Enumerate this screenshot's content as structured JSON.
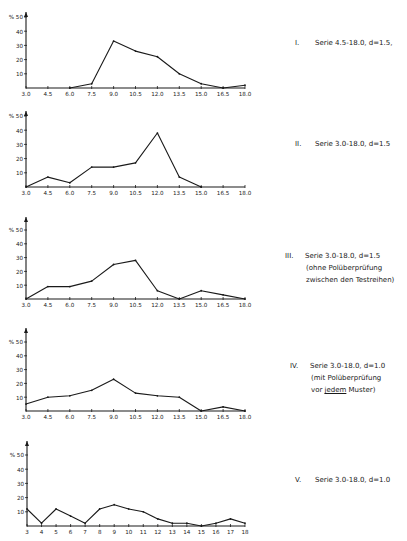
{
  "page": {
    "page_number_fragment": "555"
  },
  "chart_data": [
    {
      "type": "line",
      "id": "I",
      "title": "I. Serie 4.5-18.0, d=1.5,",
      "label_lines": [
        "Serie 4.5-18.0, d=1.5,"
      ],
      "numeral": "I.",
      "xlabel": "",
      "ylabel": "%",
      "x_ticks": [
        "3.0",
        "4.5",
        "6.0",
        "7.5",
        "9.0",
        "10.5",
        "12.0",
        "13.5",
        "15.0",
        "16.5",
        "18.0"
      ],
      "y_ticks": [
        "10",
        "20",
        "30",
        "40",
        "50"
      ],
      "xlim": [
        3.0,
        18.0
      ],
      "ylim": [
        0,
        50
      ],
      "x": [
        6.0,
        7.5,
        9.0,
        10.5,
        12.0,
        13.5,
        15.0,
        16.5,
        18.0
      ],
      "values": [
        0,
        3,
        33,
        26,
        22,
        10,
        3,
        0,
        2
      ]
    },
    {
      "type": "line",
      "id": "II",
      "title": "II. Serie 3.0-18.0, d=1.5",
      "label_lines": [
        "Serie 3.0-18.0, d=1.5"
      ],
      "numeral": "II.",
      "xlabel": "",
      "ylabel": "%",
      "x_ticks": [
        "3.0",
        "4.5",
        "6.0",
        "7.5",
        "9.0",
        "10.5",
        "12.0",
        "13.5",
        "15.0",
        "16.5",
        "18.0"
      ],
      "y_ticks": [
        "10",
        "20",
        "30",
        "40",
        "50"
      ],
      "xlim": [
        3.0,
        18.0
      ],
      "ylim": [
        0,
        50
      ],
      "x": [
        3.0,
        4.5,
        6.0,
        7.5,
        9.0,
        10.5,
        12.0,
        13.5,
        15.0
      ],
      "values": [
        0,
        7,
        3,
        14,
        14,
        17,
        38,
        7,
        0
      ]
    },
    {
      "type": "line",
      "id": "III",
      "title": "III. Serie 3.0-18.0, d=1.5 (ohne Polüberprüfung zwischen den Testreihen)",
      "label_lines": [
        "Serie 3.0-18.0, d=1.5",
        "(ohne Polüberprüfung",
        "zwischen den Testreihen)"
      ],
      "numeral": "III.",
      "xlabel": "",
      "ylabel": "%",
      "x_ticks": [
        "3.0",
        "4.5",
        "6.0",
        "7.5",
        "9.0",
        "10.5",
        "12.0",
        "13.5",
        "15.0",
        "16.5",
        "18.0"
      ],
      "y_ticks": [
        "10",
        "20",
        "30",
        "40",
        "50"
      ],
      "xlim": [
        3.0,
        18.0
      ],
      "ylim": [
        0,
        50
      ],
      "x": [
        3.0,
        4.5,
        6.0,
        7.5,
        9.0,
        10.5,
        12.0,
        13.5,
        15.0,
        16.5,
        18.0
      ],
      "values": [
        0,
        9,
        9,
        13,
        25,
        28,
        6,
        0,
        6,
        3,
        0
      ]
    },
    {
      "type": "line",
      "id": "IV",
      "title": "IV. Serie 3.0-18.0, d=1.0 (mit Polüberprüfung vor jedem Muster)",
      "label_lines": [
        "Serie 3.0-18.0, d=1.0",
        "(mit Polüberprüfung",
        "vor jedem Muster)"
      ],
      "numeral": "IV.",
      "xlabel": "",
      "ylabel": "%",
      "x_ticks": [
        "3.0",
        "4.5",
        "6.0",
        "7.5",
        "9.0",
        "10.5",
        "12.0",
        "13.5",
        "15.0",
        "16.5",
        "18.0"
      ],
      "y_ticks": [
        "10",
        "20",
        "30",
        "40",
        "50"
      ],
      "xlim": [
        3.0,
        18.0
      ],
      "ylim": [
        0,
        50
      ],
      "x": [
        3.0,
        4.5,
        6.0,
        7.5,
        9.0,
        10.5,
        12.0,
        13.5,
        15.0,
        16.5,
        18.0
      ],
      "values": [
        5,
        10,
        11,
        15,
        23,
        13,
        11,
        10,
        0,
        3,
        0
      ]
    },
    {
      "type": "line",
      "id": "V",
      "title": "V. Serie 3.0-18.0, d=1.0",
      "label_lines": [
        "Serie 3.0-18.0, d=1.0"
      ],
      "numeral": "V.",
      "xlabel": "",
      "ylabel": "%",
      "x_ticks": [
        "3",
        "4",
        "5",
        "6",
        "7",
        "8",
        "9",
        "10",
        "11",
        "12",
        "13",
        "14",
        "15",
        "16",
        "17",
        "18"
      ],
      "y_ticks": [
        "10",
        "20",
        "30",
        "40",
        "50"
      ],
      "xlim": [
        3,
        18
      ],
      "ylim": [
        0,
        50
      ],
      "x": [
        3,
        4,
        5,
        6,
        7,
        8,
        9,
        10,
        11,
        12,
        13,
        14,
        15,
        16,
        17,
        18
      ],
      "values": [
        12,
        2,
        12,
        7,
        2,
        12,
        15,
        12,
        10,
        5,
        2,
        2,
        0,
        2,
        5,
        2
      ]
    }
  ],
  "layout": {
    "charts": [
      {
        "axis_x": 26,
        "x_end": 245,
        "base_y": 88,
        "top_y": 17,
        "arrow_y": 12,
        "label_x": 295,
        "label_y": 37
      },
      {
        "axis_x": 26,
        "x_end": 245,
        "base_y": 187,
        "top_y": 116,
        "arrow_y": 111,
        "label_x": 295,
        "label_y": 138
      },
      {
        "axis_x": 26,
        "x_end": 245,
        "base_y": 299,
        "top_y": 230,
        "arrow_y": 217,
        "label_x": 285,
        "label_y": 250
      },
      {
        "axis_x": 26,
        "x_end": 245,
        "base_y": 411,
        "top_y": 342,
        "arrow_y": 328,
        "label_x": 290,
        "label_y": 360
      },
      {
        "axis_x": 27,
        "x_end": 245,
        "base_y": 526,
        "top_y": 455,
        "arrow_y": 441,
        "label_x": 295,
        "label_y": 474
      }
    ]
  }
}
